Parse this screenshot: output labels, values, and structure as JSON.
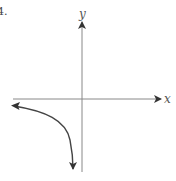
{
  "problem": {
    "number": "4."
  },
  "graph": {
    "x_axis_label": "x",
    "y_axis_label": "y",
    "axis_color": "#888888",
    "curve_color": "#444444",
    "curve_description": "Third-quadrant branch of a hyperbola, approaching the negative x-axis to the left and the negative y-axis downward"
  }
}
